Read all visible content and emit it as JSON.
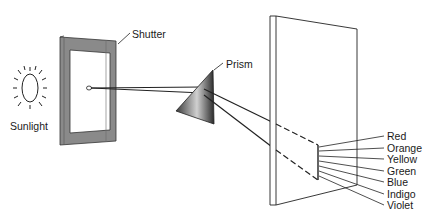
{
  "diagram": {
    "type": "prism-dispersion",
    "labels": {
      "sunlight": "Sunlight",
      "shutter": "Shutter",
      "prism": "Prism"
    },
    "spectrum": [
      {
        "name": "Red"
      },
      {
        "name": "Orange"
      },
      {
        "name": "Yellow"
      },
      {
        "name": "Green"
      },
      {
        "name": "Blue"
      },
      {
        "name": "Indigo"
      },
      {
        "name": "Violet"
      }
    ],
    "colors": {
      "line": "#222222",
      "shutter_frame": "#8a8a8a",
      "prism_dark": "#2a2a2a",
      "prism_light": "#d8d8d8"
    }
  }
}
